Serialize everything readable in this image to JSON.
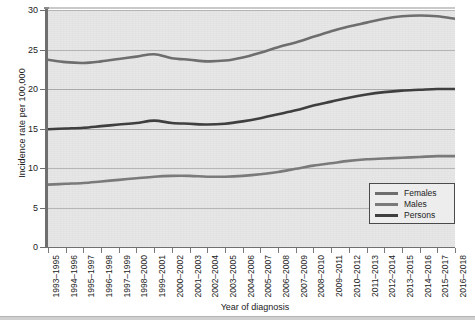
{
  "chart_data": {
    "type": "line",
    "title": "",
    "xlabel": "Year of diagnosis",
    "ylabel": "Incidence rate per 100,000",
    "ylim": [
      0,
      30
    ],
    "yticks": [
      0,
      5,
      10,
      15,
      20,
      25,
      30
    ],
    "grid": true,
    "legend_position": "bottom-right",
    "categories": [
      "1993–1995",
      "1994–1996",
      "1995–1997",
      "1996–1998",
      "1997–1999",
      "1998–2000",
      "1999–2001",
      "2000–2002",
      "2001–2003",
      "2002–2004",
      "2003–2005",
      "2004–2006",
      "2005–2007",
      "2006–2008",
      "2007–2009",
      "2008–2010",
      "2009–2011",
      "2010–2012",
      "2011–2013",
      "2012–2014",
      "2013–2015",
      "2014–2016",
      "2015–2017",
      "2016–2018"
    ],
    "series": [
      {
        "name": "Females",
        "color": "#6e6e6e",
        "values": [
          23.7,
          23.4,
          23.3,
          23.5,
          23.8,
          24.1,
          24.4,
          23.9,
          23.7,
          23.5,
          23.6,
          24.0,
          24.6,
          25.3,
          25.9,
          26.6,
          27.3,
          27.9,
          28.4,
          28.9,
          29.2,
          29.3,
          29.2,
          28.9
        ]
      },
      {
        "name": "Males",
        "color": "#7a7a7a",
        "values": [
          7.9,
          8.0,
          8.1,
          8.3,
          8.5,
          8.7,
          8.9,
          9.0,
          9.0,
          8.9,
          8.9,
          9.0,
          9.2,
          9.5,
          9.9,
          10.3,
          10.6,
          10.9,
          11.1,
          11.2,
          11.3,
          11.4,
          11.5,
          11.5
        ]
      },
      {
        "name": "Persons",
        "color": "#3f3f3f",
        "values": [
          14.9,
          15.0,
          15.1,
          15.3,
          15.5,
          15.7,
          16.0,
          15.7,
          15.6,
          15.5,
          15.6,
          15.9,
          16.3,
          16.8,
          17.3,
          17.9,
          18.4,
          18.9,
          19.3,
          19.6,
          19.8,
          19.9,
          20.0,
          20.0
        ]
      }
    ]
  },
  "legend": {
    "items": [
      {
        "label": "Females"
      },
      {
        "label": "Males"
      },
      {
        "label": "Persons"
      }
    ]
  },
  "axes": {
    "y_title": "Incidence rate per 100,000",
    "x_title": "Year of diagnosis"
  },
  "colors": {
    "plot_background": "#e3e3e3",
    "gridline": "#a9a9a9",
    "axis": "#6f6f6f",
    "females": "#6e6e6e",
    "males": "#7a7a7a",
    "persons": "#3f3f3f"
  }
}
